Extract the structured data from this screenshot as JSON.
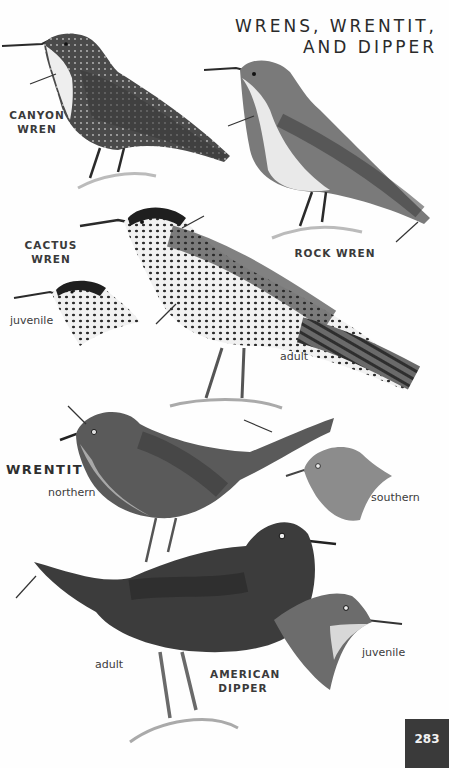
{
  "page": {
    "title_line1": "WRENS, WRENTIT,",
    "title_line2": "AND DIPPER",
    "page_number": "283"
  },
  "species": [
    {
      "name_line1": "CANYON",
      "name_line2": "WREN",
      "notes": []
    },
    {
      "name_line1": "ROCK WREN",
      "name_line2": "",
      "notes": []
    },
    {
      "name_line1": "CACTUS",
      "name_line2": "WREN",
      "notes": [
        "juvenile",
        "adult"
      ]
    },
    {
      "name_line1": "WRENTIT",
      "name_line2": "",
      "notes": [
        "northern",
        "southern"
      ]
    },
    {
      "name_line1": "AMERICAN",
      "name_line2": "DIPPER",
      "notes": [
        "adult",
        "juvenile"
      ]
    }
  ],
  "colors": {
    "background": "#fefefe",
    "text": "#2b2b2b",
    "page_tab": "#3a3a3a"
  }
}
